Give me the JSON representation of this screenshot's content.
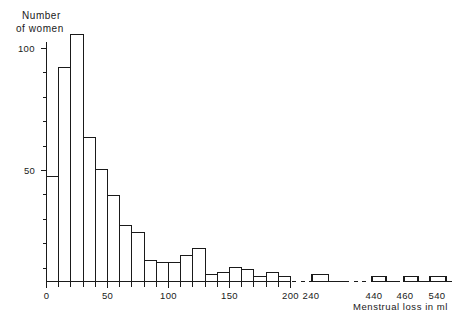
{
  "chart_data": {
    "type": "bar",
    "title": "Number of women",
    "title_line1": "Number",
    "title_line2": "of women",
    "xlabel": "Menstrual loss in ml",
    "ylabel": "Number of women",
    "xlim": [
      0,
      200
    ],
    "ylim": [
      0,
      110
    ],
    "grid": false,
    "legend": null,
    "axis_break": true,
    "axis_break_note": "x-axis is broken after 200 ml; remaining observations shown as isolated bars at 240, 440, 460 and 540 ml",
    "y_ticks_major": [
      50,
      100
    ],
    "y_ticks_minor": [
      10,
      20,
      30,
      40,
      60,
      70,
      80,
      90
    ],
    "y_tick_labels": [
      "50",
      "100"
    ],
    "x_ticks_main": [
      0,
      10,
      20,
      30,
      40,
      50,
      60,
      70,
      80,
      90,
      100,
      110,
      120,
      130,
      140,
      150,
      160,
      170,
      180,
      190,
      200
    ],
    "x_tick_labels_main": [
      "0",
      "50",
      "100",
      "150",
      "200"
    ],
    "x_tick_labels_broken": [
      "240",
      "440",
      "460",
      "540"
    ],
    "bin_width": 10,
    "categories": [
      "0-10",
      "10-20",
      "20-30",
      "30-40",
      "40-50",
      "50-60",
      "60-70",
      "70-80",
      "80-90",
      "90-100",
      "100-110",
      "110-120",
      "120-130",
      "130-140",
      "140-150",
      "150-160",
      "160-170",
      "170-180",
      "180-190",
      "190-200"
    ],
    "bin_starts": [
      0,
      10,
      20,
      30,
      40,
      50,
      60,
      70,
      80,
      90,
      100,
      110,
      120,
      130,
      140,
      150,
      160,
      170,
      180,
      190
    ],
    "values": [
      45,
      92,
      106,
      62,
      48,
      37,
      24,
      21,
      9,
      8,
      8,
      11,
      14,
      3,
      4,
      6,
      5,
      2,
      4,
      2
    ],
    "outlier_bins": [
      {
        "label": "240",
        "start": 240,
        "value": 3
      },
      {
        "label": "440",
        "start": 440,
        "value": 2
      },
      {
        "label": "460",
        "start": 460,
        "value": 2
      },
      {
        "label": "540",
        "start": 540,
        "value": 2
      }
    ],
    "colors": {
      "bar_fill": "#ffffff",
      "bar_stroke": "#1a1a1a",
      "axis": "#1a1a1a",
      "text": "#1a1a1a",
      "background": "#ffffff"
    }
  }
}
